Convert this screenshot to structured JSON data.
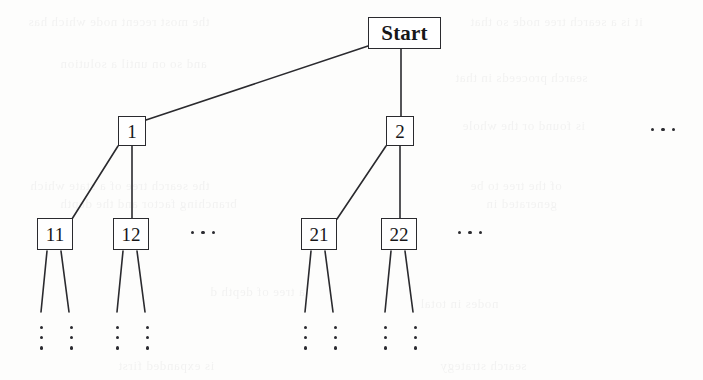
{
  "figure": {
    "type": "tree-diagram",
    "width": 703,
    "height": 380,
    "background_color": "#fdfdfc",
    "line_color": "#2a2a2e",
    "text_color": "#171719"
  },
  "nodes": {
    "root": {
      "id": "start",
      "label": "Start",
      "x": 368,
      "y": 17,
      "w": 73,
      "h": 32,
      "bold": true
    },
    "level1": [
      {
        "id": "n1",
        "label": "1",
        "x": 118,
        "y": 116,
        "w": 28,
        "h": 30
      },
      {
        "id": "n2",
        "label": "2",
        "x": 386,
        "y": 116,
        "w": 28,
        "h": 30
      }
    ],
    "level2": [
      {
        "id": "n11",
        "label": "11",
        "x": 37,
        "y": 218,
        "w": 36,
        "h": 32
      },
      {
        "id": "n12",
        "label": "12",
        "x": 113,
        "y": 218,
        "w": 36,
        "h": 32
      },
      {
        "id": "n21",
        "label": "21",
        "x": 301,
        "y": 218,
        "w": 36,
        "h": 32
      },
      {
        "id": "n22",
        "label": "22",
        "x": 381,
        "y": 218,
        "w": 36,
        "h": 32
      }
    ]
  },
  "edges": [
    {
      "from": "start",
      "to": "n1",
      "x1": 368,
      "y1": 46,
      "x2": 146,
      "y2": 120
    },
    {
      "from": "start",
      "to": "n2",
      "x1": 401,
      "y1": 49,
      "x2": 401,
      "y2": 116
    },
    {
      "from": "n1",
      "to": "n11",
      "x1": 118,
      "y1": 146,
      "x2": 72,
      "y2": 219
    },
    {
      "from": "n1",
      "to": "n12",
      "x1": 132,
      "y1": 146,
      "x2": 132,
      "y2": 218
    },
    {
      "from": "n2",
      "to": "n21",
      "x1": 386,
      "y1": 146,
      "x2": 337,
      "y2": 219
    },
    {
      "from": "n2",
      "to": "n22",
      "x1": 400,
      "y1": 146,
      "x2": 400,
      "y2": 218
    }
  ],
  "leaf_stubs": [
    {
      "parent": "n11",
      "x1": 47,
      "y1": 251,
      "x2": 41,
      "y2": 312
    },
    {
      "parent": "n11",
      "x1": 61,
      "y1": 251,
      "x2": 69,
      "y2": 312
    },
    {
      "parent": "n12",
      "x1": 123,
      "y1": 251,
      "x2": 117,
      "y2": 312
    },
    {
      "parent": "n12",
      "x1": 137,
      "y1": 251,
      "x2": 145,
      "y2": 312
    },
    {
      "parent": "n21",
      "x1": 311,
      "y1": 251,
      "x2": 305,
      "y2": 312
    },
    {
      "parent": "n21",
      "x1": 325,
      "y1": 251,
      "x2": 333,
      "y2": 312
    },
    {
      "parent": "n22",
      "x1": 391,
      "y1": 251,
      "x2": 385,
      "y2": 312
    },
    {
      "parent": "n22",
      "x1": 405,
      "y1": 251,
      "x2": 413,
      "y2": 312
    }
  ],
  "horizontal_ellipses": [
    {
      "id": "ellipsis-level2-left",
      "label": "...",
      "x": 191,
      "y": 231,
      "note": "more children after 12"
    },
    {
      "id": "ellipsis-level2-right",
      "label": "...",
      "x": 458,
      "y": 231,
      "note": "more children after 22"
    },
    {
      "id": "ellipsis-level1-right",
      "label": "...",
      "x": 651,
      "y": 128,
      "note": "more children after 2"
    }
  ],
  "vertical_ellipses": [
    {
      "id": "vdots-11-a",
      "label": "⋮",
      "x": 40,
      "y": 326
    },
    {
      "id": "vdots-11-b",
      "label": "⋮",
      "x": 70,
      "y": 326
    },
    {
      "id": "vdots-12-a",
      "label": "⋮",
      "x": 116,
      "y": 326
    },
    {
      "id": "vdots-12-b",
      "label": "⋮",
      "x": 146,
      "y": 326
    },
    {
      "id": "vdots-21-a",
      "label": "⋮",
      "x": 304,
      "y": 326
    },
    {
      "id": "vdots-21-b",
      "label": "⋮",
      "x": 334,
      "y": 326
    },
    {
      "id": "vdots-22-a",
      "label": "⋮",
      "x": 384,
      "y": 326
    },
    {
      "id": "vdots-22-b",
      "label": "⋮",
      "x": 414,
      "y": 326
    }
  ],
  "ghost_text": {
    "note": "faint mirrored bleed-through text from reverse side of scanned page, not legible content",
    "lines": [
      {
        "text": "the most recent node which has",
        "x": 28,
        "y": 14
      },
      {
        "text": "it is a search tree node so that",
        "x": 470,
        "y": 14
      },
      {
        "text": "and so on until a solution",
        "x": 60,
        "y": 56
      },
      {
        "text": "search proceeds in that",
        "x": 455,
        "y": 70
      },
      {
        "text": "is found or the whole",
        "x": 462,
        "y": 118
      },
      {
        "text": "the search tree of a state which",
        "x": 30,
        "y": 178
      },
      {
        "text": "branching factor and the depth",
        "x": 60,
        "y": 196
      },
      {
        "text": "of the tree to be",
        "x": 470,
        "y": 178
      },
      {
        "text": "generated in",
        "x": 486,
        "y": 196
      },
      {
        "text": "a tree of depth d",
        "x": 210,
        "y": 284
      },
      {
        "text": "nodes in total",
        "x": 420,
        "y": 296
      },
      {
        "text": "is expanded first",
        "x": 118,
        "y": 358
      },
      {
        "text": "search strategy",
        "x": 440,
        "y": 358
      }
    ]
  }
}
